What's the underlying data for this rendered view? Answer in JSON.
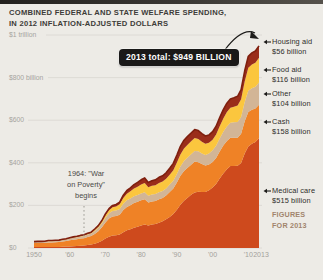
{
  "title": {
    "line1": "COMBINED FEDERAL AND STATE WELFARE SPENDING,",
    "line2": "IN 2012 INFLATION-ADJUSTED DOLLARS"
  },
  "badge": {
    "text": "2013 total: $949 BILLION"
  },
  "annotation": {
    "line1": "1964: \"War",
    "line2": "on Poverty\"",
    "line3": "begins",
    "year": 1964
  },
  "figures_note": {
    "line1": "FIGURES",
    "line2": "FOR 2013",
    "color": "#a1846c"
  },
  "legend": [
    {
      "name": "Housing aid",
      "value": "$56 billion"
    },
    {
      "name": "Food aid",
      "value": "$116 billion"
    },
    {
      "name": "Other",
      "value": "$104 billion"
    },
    {
      "name": "Cash",
      "value": "$158 billion"
    },
    {
      "name": "Medical care",
      "value": "$515 billion"
    }
  ],
  "axes": {
    "y_ticks": [
      {
        "label": "$1 trillion",
        "value": 1000
      },
      {
        "label": "$800 billion",
        "value": 800
      },
      {
        "label": "$600",
        "value": 600
      },
      {
        "label": "$400",
        "value": 400
      },
      {
        "label": "$200",
        "value": 200
      },
      {
        "label": "$0",
        "value": 0
      }
    ],
    "x_ticks": [
      {
        "label": "1950",
        "year": 1950
      },
      {
        "label": "'60",
        "year": 1960
      },
      {
        "label": "'70",
        "year": 1970
      },
      {
        "label": "'80",
        "year": 1980
      },
      {
        "label": "'90",
        "year": 1990
      },
      {
        "label": "'00",
        "year": 2000
      },
      {
        "label": "'10",
        "year": 2010
      },
      {
        "label": "2013",
        "year": 2013
      }
    ]
  },
  "chart_data": {
    "type": "area",
    "stacked": true,
    "title": "Combined federal and state welfare spending, in 2012 inflation-adjusted dollars",
    "unit": "billions of 2012 dollars",
    "xlim": [
      1950,
      2013
    ],
    "ylim": [
      0,
      1000
    ],
    "total_2013": 949,
    "outline_color": "#7f1f0e",
    "grid_color": "#d9d6d0",
    "years": [
      1950,
      1951,
      1952,
      1953,
      1954,
      1955,
      1956,
      1957,
      1958,
      1959,
      1960,
      1961,
      1962,
      1963,
      1964,
      1965,
      1966,
      1967,
      1968,
      1969,
      1970,
      1971,
      1972,
      1973,
      1974,
      1975,
      1976,
      1977,
      1978,
      1979,
      1980,
      1981,
      1982,
      1983,
      1984,
      1985,
      1986,
      1987,
      1988,
      1989,
      1990,
      1991,
      1992,
      1993,
      1994,
      1995,
      1996,
      1997,
      1998,
      1999,
      2000,
      2001,
      2002,
      2003,
      2004,
      2005,
      2006,
      2007,
      2008,
      2009,
      2010,
      2011,
      2012,
      2013
    ],
    "series": [
      {
        "name": "Medical care",
        "color": "#ce4a1d",
        "values": [
          4,
          4,
          4,
          4,
          5,
          5,
          5,
          5,
          6,
          7,
          7,
          8,
          9,
          11,
          12,
          14,
          16,
          20,
          26,
          34,
          45,
          53,
          58,
          60,
          64,
          74,
          83,
          88,
          95,
          100,
          106,
          110,
          105,
          110,
          113,
          119,
          126,
          135,
          146,
          160,
          180,
          203,
          222,
          236,
          250,
          261,
          264,
          263,
          263,
          271,
          284,
          301,
          326,
          350,
          370,
          385,
          385,
          386,
          399,
          444,
          477,
          489,
          498,
          515
        ]
      },
      {
        "name": "Cash",
        "color": "#ef8226",
        "values": [
          19,
          19,
          19,
          20,
          21,
          21,
          22,
          23,
          25,
          26,
          29,
          31,
          32,
          33,
          34,
          37,
          40,
          46,
          53,
          63,
          75,
          85,
          90,
          90,
          92,
          104,
          110,
          113,
          116,
          117,
          118,
          119,
          109,
          109,
          108,
          110,
          109,
          111,
          117,
          119,
          128,
          136,
          140,
          141,
          141,
          145,
          139,
          131,
          124,
          121,
          120,
          122,
          127,
          131,
          133,
          133,
          133,
          132,
          137,
          151,
          162,
          160,
          157,
          158
        ]
      },
      {
        "name": "Other",
        "color": "#d2b596",
        "values": [
          5,
          5,
          5,
          5,
          6,
          6,
          6,
          6,
          7,
          7,
          8,
          9,
          9,
          10,
          11,
          12,
          12,
          14,
          16,
          19,
          22,
          25,
          26,
          26,
          27,
          30,
          31,
          32,
          32,
          32,
          32,
          33,
          31,
          32,
          32,
          33,
          33,
          34,
          35,
          37,
          40,
          43,
          46,
          48,
          49,
          50,
          51,
          50,
          50,
          52,
          55,
          57,
          61,
          65,
          68,
          70,
          72,
          74,
          79,
          90,
          99,
          101,
          102,
          104
        ]
      },
      {
        "name": "Food aid",
        "color": "#fbc63e",
        "values": [
          1,
          1,
          1,
          1,
          1,
          1,
          1,
          1,
          1,
          1,
          2,
          2,
          2,
          2,
          2,
          3,
          3,
          5,
          6,
          8,
          11,
          14,
          17,
          19,
          22,
          27,
          31,
          33,
          36,
          39,
          42,
          43,
          40,
          41,
          42,
          43,
          44,
          45,
          46,
          49,
          53,
          57,
          59,
          60,
          61,
          61,
          58,
          55,
          52,
          50,
          49,
          53,
          58,
          62,
          67,
          70,
          73,
          77,
          83,
          97,
          108,
          111,
          113,
          116
        ]
      },
      {
        "name": "Housing aid",
        "color": "#9a2d1a",
        "values": [
          1,
          2,
          2,
          2,
          2,
          2,
          2,
          2,
          2,
          2,
          2,
          2,
          3,
          3,
          3,
          3,
          3,
          4,
          4,
          5,
          7,
          8,
          9,
          9,
          10,
          13,
          15,
          16,
          18,
          20,
          22,
          24,
          23,
          24,
          25,
          27,
          27,
          28,
          30,
          32,
          35,
          38,
          39,
          39,
          39,
          39,
          39,
          38,
          37,
          37,
          38,
          39,
          40,
          42,
          42,
          42,
          42,
          43,
          45,
          50,
          54,
          55,
          55,
          56
        ]
      }
    ]
  }
}
